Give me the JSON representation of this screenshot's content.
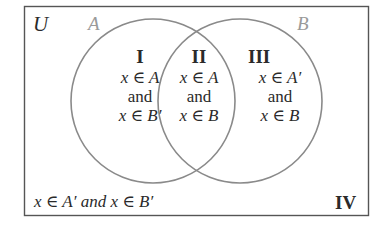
{
  "diagram": {
    "universal_label": "U",
    "set_a_label": "A",
    "set_b_label": "B",
    "colors": {
      "border": "#555555",
      "circle": "#8a8a8a",
      "set_label": "#9a9a9a",
      "text": "#2a2a2a"
    },
    "regions": [
      {
        "numeral": "I",
        "line1": "x ∈ A",
        "line2": "and",
        "line3": "x ∈ B′"
      },
      {
        "numeral": "II",
        "line1": "x ∈ A",
        "line2": "and",
        "line3": "x ∈ B"
      },
      {
        "numeral": "III",
        "line1": "x ∈ A′",
        "line2": "and",
        "line3": "x ∈ B"
      }
    ],
    "outside": {
      "numeral": "IV",
      "text": "x ∈ A′ and x ∈ B′"
    }
  }
}
